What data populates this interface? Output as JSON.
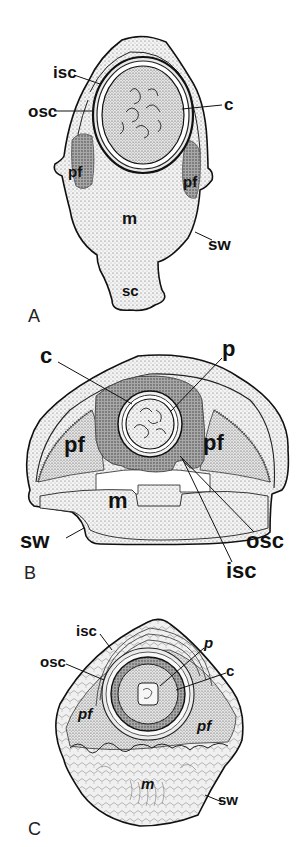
{
  "figure": {
    "panels": [
      {
        "id": "A",
        "label": "A",
        "labels": {
          "isc": "isc",
          "osc": "osc",
          "c": "c",
          "pf_left": "pf",
          "pf_right": "pf",
          "m": "m",
          "sw": "sw",
          "sc": "sc"
        }
      },
      {
        "id": "B",
        "label": "B",
        "labels": {
          "c": "c",
          "p": "p",
          "pf_left": "pf",
          "pf_right": "pf",
          "m": "m",
          "sw": "sw",
          "osc": "osc",
          "isc": "isc"
        }
      },
      {
        "id": "C",
        "label": "C",
        "labels": {
          "isc": "isc",
          "p": "p",
          "osc": "osc",
          "c": "c",
          "pf_left": "pf",
          "pf_right": "pf",
          "m": "m",
          "sw": "sw"
        }
      }
    ],
    "colors": {
      "ink": "#111111",
      "light_fill": "#ececec",
      "mid_fill": "#cfcfcf",
      "dark_fill": "#9a9a9a",
      "background": "#ffffff"
    }
  }
}
